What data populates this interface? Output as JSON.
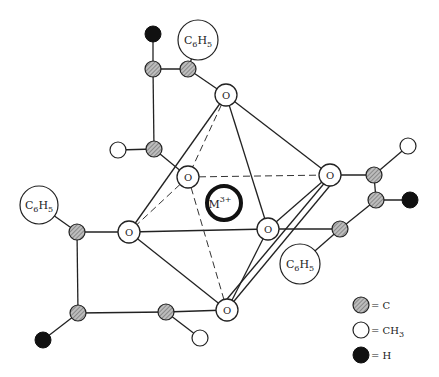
{
  "diagram": {
    "metal": {
      "label": "M",
      "charge": "3+",
      "x": 224,
      "y": 203,
      "r": 18
    },
    "oxygens": [
      {
        "id": "O_top",
        "label": "O",
        "x": 226,
        "y": 95
      },
      {
        "id": "O_back",
        "label": "O",
        "x": 188,
        "y": 177
      },
      {
        "id": "O_right",
        "label": "O",
        "x": 330,
        "y": 175
      },
      {
        "id": "O_left",
        "label": "O",
        "x": 129,
        "y": 232
      },
      {
        "id": "O_front",
        "label": "O",
        "x": 268,
        "y": 229
      },
      {
        "id": "O_bottom",
        "label": "O",
        "x": 227,
        "y": 310
      }
    ],
    "phenyl_label": {
      "main": "C",
      "sub1": "6",
      "mid": "H",
      "sub2": "5"
    },
    "phenyls": [
      {
        "x": 198,
        "y": 40,
        "r": 20
      },
      {
        "x": 39,
        "y": 205,
        "r": 19
      },
      {
        "x": 300,
        "y": 264,
        "r": 20
      }
    ]
  },
  "legend": {
    "items": [
      {
        "symbol": "hatched-circle",
        "text": "= C"
      },
      {
        "symbol": "open-circle",
        "text": "= CH",
        "sub": "3"
      },
      {
        "symbol": "filled-circle",
        "text": "= H"
      }
    ]
  }
}
